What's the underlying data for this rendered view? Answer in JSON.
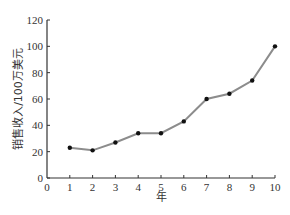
{
  "chart_data": {
    "type": "line",
    "title": "",
    "xlabel": "年",
    "ylabel": "销售收入/100万美元",
    "x": [
      1,
      2,
      3,
      4,
      5,
      6,
      7,
      8,
      9,
      10
    ],
    "series": [
      {
        "name": "销售收入",
        "values": [
          23,
          21,
          27,
          34,
          34,
          43,
          60,
          64,
          74,
          100
        ],
        "line_color": "#8c8c8c",
        "marker_color": "#111111"
      }
    ],
    "xlim": [
      0,
      10
    ],
    "ylim": [
      0,
      120
    ],
    "x_ticks": [
      0,
      1,
      2,
      3,
      4,
      5,
      6,
      7,
      8,
      9,
      10
    ],
    "y_ticks": [
      0,
      20,
      40,
      60,
      80,
      100,
      120
    ],
    "grid": false,
    "legend": "none"
  }
}
